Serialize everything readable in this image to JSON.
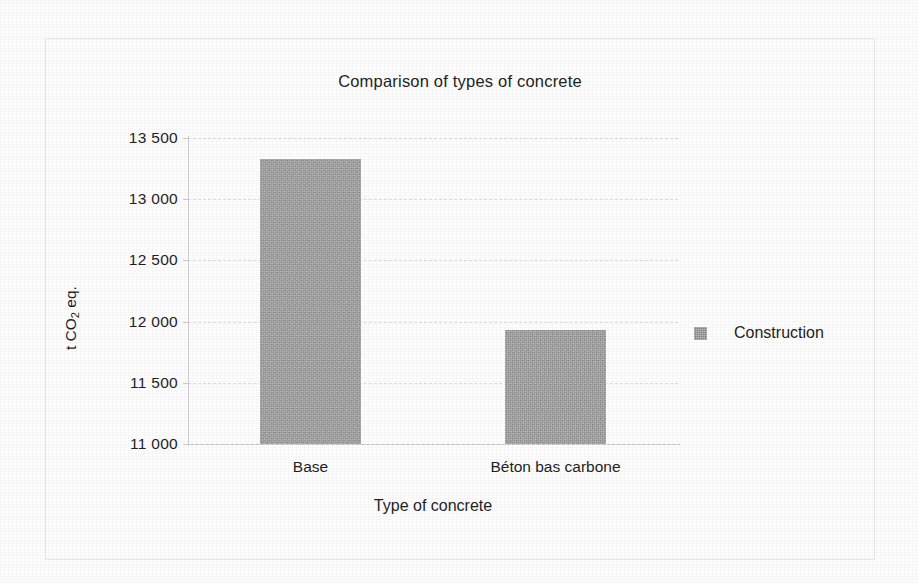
{
  "chart_data": {
    "type": "bar",
    "title": "Comparison of types of concrete",
    "xlabel": "Type of concrete",
    "ylabel": "t CO2 eq.",
    "ylabel_parts": {
      "prefix": "t CO",
      "sub": "2",
      "suffix": " eq."
    },
    "categories": [
      "Base",
      "Béton bas carbone"
    ],
    "series": [
      {
        "name": "Construction",
        "values": [
          13330,
          11930
        ],
        "color": "#9c9c9c"
      }
    ],
    "ylim": [
      11000,
      13500
    ],
    "ytick_labels": [
      "13 500",
      "13 000",
      "12 500",
      "12 000",
      "11 500",
      "11 000"
    ],
    "ytick_values": [
      13500,
      13000,
      12500,
      12000,
      11500,
      11000
    ],
    "grid": true,
    "grid_style": "dashed",
    "grid_color": "#dcdcdc",
    "legend": {
      "position": "right",
      "entries": [
        {
          "label": "Construction",
          "color": "#9c9c9c"
        }
      ]
    },
    "bar_color": "#9c9c9c",
    "background_color": "#ffffff",
    "border_color": "#e8e8e8"
  }
}
